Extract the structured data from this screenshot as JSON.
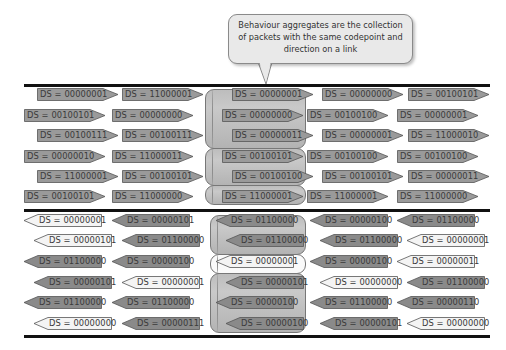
{
  "callout": {
    "lines": [
      "Behaviour aggregates are the collection",
      "of packets with the same codepoint and",
      "direction on a link"
    ]
  },
  "colors": {
    "forward_arrow": "#9a9a9a",
    "backward_dark_arrow": "#8a8a8a",
    "backward_light_arrow": "#f4f4f4",
    "pipe_gray": "#c0c0c0",
    "pipe_white": "#fafafa",
    "link_line": "#111111"
  },
  "top_link": {
    "direction": "right",
    "rows": [
      [
        "DS = 00000001",
        "DS = 11000001",
        "DS = 00000001",
        "DS = 00000000",
        "DS = 00100101"
      ],
      [
        "DS = 00100101",
        "DS = 00000000",
        "DS = 00000000",
        "DS = 00100100",
        "DS = 00000001"
      ],
      [
        "DS = 00100111",
        "DS = 00100111",
        "DS = 00000011",
        "DS = 00000001",
        "DS = 11000010"
      ],
      [
        "DS = 00000010",
        "DS = 11000011",
        "DS = 00100101",
        "DS = 00100100",
        "DS = 00100100"
      ],
      [
        "DS = 11000001",
        "DS = 00100101",
        "DS = 00100100",
        "DS = 00100101",
        "DS = 00000011"
      ],
      [
        "DS = 00100101",
        "DS = 11000000",
        "DS = 11000001",
        "DS = 11000001",
        "DS = 11000000"
      ]
    ]
  },
  "bottom_link": {
    "direction": "left",
    "rows": [
      [
        "DS = 00000001",
        "DS = 00000101",
        "DS = 01100000",
        "DS = 00000100",
        "DS = 01100000"
      ],
      [
        "DS = 00000101",
        "DS = 01100000",
        "DS = 01100000",
        "DS = 01100000",
        "DS = 00000001"
      ],
      [
        "DS = 01100000",
        "DS = 00000100",
        "DS = 00000001",
        "DS = 00000100",
        "DS = 00000011"
      ],
      [
        "DS = 00000101",
        "DS = 00000001",
        "DS = 00000101",
        "DS = 00000000",
        "DS = 01100000"
      ],
      [
        "DS = 01100000",
        "DS = 01100000",
        "DS = 00000100",
        "DS = 01100000",
        "DS = 00000110"
      ],
      [
        "DS = 00000000",
        "DS = 00000111",
        "DS = 00000100",
        "DS = 00000101",
        "DS = 00000000"
      ]
    ],
    "light_cells": [
      [
        0,
        0
      ],
      [
        1,
        0
      ],
      [
        5,
        0
      ],
      [
        3,
        1
      ],
      [
        2,
        2
      ],
      [
        1,
        4
      ],
      [
        2,
        4
      ],
      [
        3,
        3
      ],
      [
        5,
        4
      ]
    ]
  }
}
